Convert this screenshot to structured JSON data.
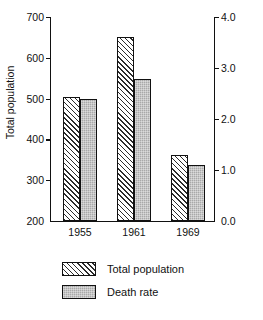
{
  "chart_data": {
    "type": "bar",
    "title": "",
    "xlabel": "",
    "categories": [
      "1955",
      "1961",
      "1969"
    ],
    "series": [
      {
        "name": "Total population",
        "axis": "left",
        "fill": "diagonal-hatch",
        "values": [
          505,
          650,
          363
        ]
      },
      {
        "name": "Death rate",
        "axis": "right",
        "fill": "solid-gray",
        "values": [
          2.4,
          2.78,
          1.1
        ]
      }
    ],
    "left_axis": {
      "label": "Total population",
      "ylim": [
        200,
        700
      ],
      "ticks": [
        200,
        300,
        400,
        500,
        600,
        700
      ],
      "tick_labels": [
        "200",
        "300",
        "400",
        "500",
        "600",
        "700"
      ]
    },
    "right_axis": {
      "label": "Deaths per 100 men",
      "ylim": [
        0.0,
        4.0
      ],
      "ticks": [
        0.0,
        1.0,
        2.0,
        3.0,
        4.0
      ],
      "tick_labels": [
        "0.0",
        "1.0",
        "2.0",
        "3.0",
        "4.0"
      ]
    },
    "grid": false,
    "legend_position": "below-center",
    "legend": [
      "Total population",
      "Death rate"
    ],
    "colors": {
      "hatch_line": "#2b2b2b",
      "solid_fill": "#a9a9a9",
      "axis": "#111111",
      "background": "#ffffff"
    }
  }
}
